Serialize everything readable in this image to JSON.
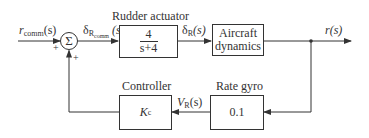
{
  "diagram": {
    "type": "feedback-control-block-diagram",
    "stroke_color": "#333333",
    "input_signal": {
      "symbol": "r",
      "subscript": "comm",
      "arg": "(s)"
    },
    "summing_junction": {
      "glyph": "Σ",
      "signs": {
        "input": "+",
        "feedback": "+"
      }
    },
    "actuator_input_signal": {
      "symbol": "δ",
      "subscript": "R",
      "subsubscript": "comm",
      "arg": "(s)"
    },
    "blocks": {
      "rudder_actuator": {
        "title": "Rudder actuator",
        "numerator": "4",
        "denominator": "s+4"
      },
      "aircraft_dynamics": {
        "line1": "Aircraft",
        "line2": "dynamics"
      },
      "controller": {
        "title": "Controller",
        "symbol": "K",
        "subscript": "c"
      },
      "rate_gyro": {
        "title": "Rate gyro",
        "value": "0.1"
      }
    },
    "actuator_output_signal": {
      "symbol": "δ",
      "subscript": "R",
      "arg": "(s)"
    },
    "output_signal": {
      "symbol": "r",
      "arg": "(s)"
    },
    "gyro_output_signal": {
      "symbol": "V",
      "subscript": "R",
      "arg": "(s)"
    }
  }
}
